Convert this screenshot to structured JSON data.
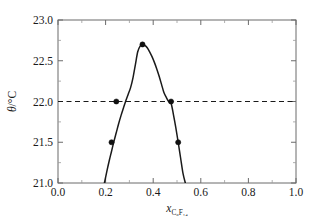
{
  "chart_data": {
    "type": "line",
    "title": "",
    "xlabel": "x_C6F14",
    "xlabel_main": "x",
    "xlabel_sub": "C₆F₁₄",
    "ylabel": "θ/°C",
    "ylabel_symbol": "θ",
    "ylabel_unit": "/°C",
    "xlim": [
      0.0,
      1.0
    ],
    "ylim": [
      21.0,
      23.0
    ],
    "xticks": [
      0.0,
      0.2,
      0.4,
      0.6,
      0.8,
      1.0
    ],
    "xticklabels": [
      "0.0",
      "0.2",
      "0.4",
      "0.6",
      "0.8",
      "1.0"
    ],
    "yticks": [
      21.0,
      21.5,
      22.0,
      22.5,
      23.0
    ],
    "yticklabels": [
      "21.0",
      "21.5",
      "22.0",
      "22.5",
      "23.0"
    ],
    "minor_xticks": [
      0.1,
      0.3,
      0.5,
      0.7,
      0.9
    ],
    "minor_yticks": [
      21.25,
      21.75,
      22.25,
      22.75
    ],
    "grid": false,
    "legend": null,
    "series": [
      {
        "name": "phase boundary curve",
        "style": "solid",
        "color": "#1a1a1a",
        "x": [
          0.195,
          0.205,
          0.215,
          0.225,
          0.235,
          0.245,
          0.255,
          0.265,
          0.275,
          0.285,
          0.295,
          0.305,
          0.315,
          0.325,
          0.335,
          0.345,
          0.355,
          0.365,
          0.375,
          0.385,
          0.395,
          0.405,
          0.415,
          0.425,
          0.435,
          0.445,
          0.455,
          0.465,
          0.475,
          0.485,
          0.495,
          0.505,
          0.515,
          0.525,
          0.535
        ],
        "y": [
          21.0,
          21.14,
          21.27,
          21.39,
          21.51,
          21.62,
          21.73,
          21.83,
          21.92,
          22.01,
          22.09,
          22.17,
          22.29,
          22.45,
          22.61,
          22.68,
          22.7,
          22.69,
          22.66,
          22.61,
          22.55,
          22.48,
          22.4,
          22.31,
          22.21,
          22.11,
          22.05,
          22.0,
          21.98,
          21.84,
          21.68,
          21.5,
          21.31,
          21.12,
          21.0
        ]
      },
      {
        "name": "reference temperature line",
        "style": "dashed",
        "color": "#1a1a1a",
        "value": 22.0,
        "x": [
          0.0,
          1.0
        ],
        "y": [
          22.0,
          22.0
        ]
      }
    ],
    "points": [
      {
        "x": 0.225,
        "y": 21.5,
        "label": ""
      },
      {
        "x": 0.245,
        "y": 22.0,
        "label": ""
      },
      {
        "x": 0.355,
        "y": 22.7,
        "label": ""
      },
      {
        "x": 0.475,
        "y": 22.0,
        "label": ""
      },
      {
        "x": 0.505,
        "y": 21.5,
        "label": ""
      }
    ],
    "annotations": []
  }
}
